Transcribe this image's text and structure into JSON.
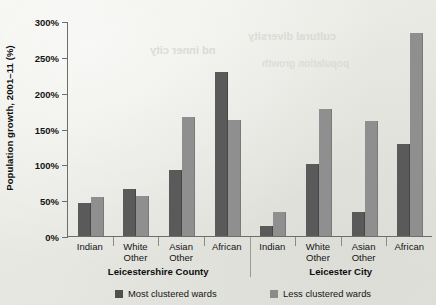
{
  "chart_data": {
    "type": "bar",
    "title": "",
    "xlabel": "",
    "ylabel": "Population growth, 2001–11 (%)",
    "ylim": [
      0,
      300
    ],
    "ytick_labels": [
      "0%",
      "50%",
      "100%",
      "150%",
      "200%",
      "250%",
      "300%"
    ],
    "ytick_values": [
      0,
      50,
      100,
      150,
      200,
      250,
      300
    ],
    "grid": false,
    "legend_position": "bottom",
    "categories": [
      "Indian",
      "White Other",
      "Asian Other",
      "African"
    ],
    "groups": [
      {
        "name": "Leicestershire County",
        "categories": [
          "Indian",
          "White Other",
          "Asian Other",
          "African"
        ],
        "series": [
          {
            "name": "Most clustered wards",
            "values": [
              46,
              65,
              92,
              229
            ]
          },
          {
            "name": "Less clustered wards",
            "values": [
              54,
              56,
              166,
              162
            ]
          }
        ]
      },
      {
        "name": "Leicester City",
        "categories": [
          "Indian",
          "White Other",
          "Asian Other",
          "African"
        ],
        "series": [
          {
            "name": "Most clustered wards",
            "values": [
              14,
              101,
              33,
              128
            ]
          },
          {
            "name": "Less clustered wards",
            "values": [
              33,
              177,
              161,
              283
            ]
          }
        ]
      }
    ],
    "legend": [
      {
        "label": "Most clustered wards",
        "color": "#4f4f4f"
      },
      {
        "label": "Less clustered wards",
        "color": "#8a8a8a"
      }
    ]
  },
  "colors": {
    "bar_dark": "#5a5a5a",
    "bar_light": "#8f8f8f",
    "axis": "#6d6d6d",
    "paper": "#ebebe7",
    "text": "#141414"
  },
  "scan_artifacts": {
    "bleed_lines": [
      "nd inner city",
      "cultural diversity",
      "population growth"
    ]
  }
}
